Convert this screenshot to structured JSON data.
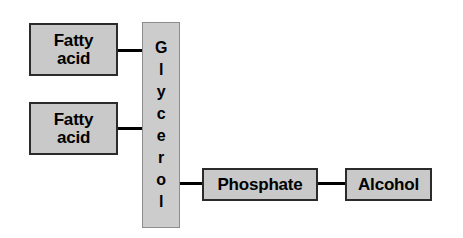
{
  "diagram": {
    "type": "block-diagram",
    "colors": {
      "box_fill": "#c9c9c9",
      "box_border": "#2b2b2b",
      "bar_fill": "#cccccc",
      "bar_border": "#8d8d8d",
      "connector": "#000000",
      "background": "#ffffff",
      "text": "#000000"
    },
    "nodes": {
      "fatty_acid_1": {
        "line1": "Fatty",
        "line2": "acid"
      },
      "fatty_acid_2": {
        "line1": "Fatty",
        "line2": "acid"
      },
      "glycerol": {
        "label": "Glycerol",
        "letters": [
          "G",
          "l",
          "y",
          "c",
          "e",
          "r",
          "o",
          "l"
        ]
      },
      "phosphate": {
        "label": "Phosphate"
      },
      "alcohol": {
        "label": "Alcohol"
      }
    },
    "connectors": [
      {
        "name": "fatty-acid-1-to-glycerol",
        "from": "fatty_acid_1",
        "to": "glycerol"
      },
      {
        "name": "fatty-acid-2-to-glycerol",
        "from": "fatty_acid_2",
        "to": "glycerol"
      },
      {
        "name": "glycerol-to-phosphate",
        "from": "glycerol",
        "to": "phosphate"
      },
      {
        "name": "phosphate-to-alcohol",
        "from": "phosphate",
        "to": "alcohol"
      }
    ]
  }
}
